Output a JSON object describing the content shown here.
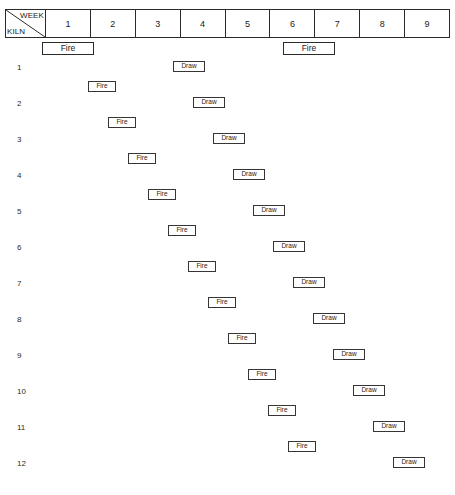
{
  "document": {
    "caption_fragment": "",
    "kiln_schedule_title": ""
  },
  "header_table": {
    "corner": {
      "top_label": "WEEK",
      "bottom_label": "KILN"
    },
    "week_columns": [
      "1",
      "2",
      "3",
      "4",
      "5",
      "6",
      "7",
      "8",
      "9"
    ]
  },
  "header_events": [
    {
      "label": "Fire",
      "x": 42,
      "y": 42,
      "w": 52,
      "h": 13
    },
    {
      "label": "Fire",
      "x": 283,
      "y": 42,
      "w": 52,
      "h": 13
    }
  ],
  "kiln_rows": [
    {
      "kiln": "1",
      "label_x": 17,
      "label_y": 63,
      "draw": {
        "label": "Draw",
        "x": 173,
        "y": 61,
        "w": 32,
        "h": 11
      },
      "fire": {
        "label": "Fire",
        "x": 88,
        "y": 81,
        "w": 28,
        "h": 11
      }
    },
    {
      "kiln": "2",
      "label_x": 17,
      "label_y": 99,
      "draw": {
        "label": "Draw",
        "x": 193,
        "y": 97,
        "w": 32,
        "h": 11
      },
      "fire": {
        "label": "Fire",
        "x": 108,
        "y": 117,
        "w": 28,
        "h": 11
      }
    },
    {
      "kiln": "3",
      "label_x": 17,
      "label_y": 135,
      "draw": {
        "label": "Draw",
        "x": 213,
        "y": 133,
        "w": 32,
        "h": 11
      },
      "fire": {
        "label": "Fire",
        "x": 128,
        "y": 153,
        "w": 28,
        "h": 11
      }
    },
    {
      "kiln": "4",
      "label_x": 17,
      "label_y": 171,
      "draw": {
        "label": "Draw",
        "x": 233,
        "y": 169,
        "w": 32,
        "h": 11
      },
      "fire": {
        "label": "Fire",
        "x": 148,
        "y": 189,
        "w": 28,
        "h": 11
      }
    },
    {
      "kiln": "5",
      "label_x": 17,
      "label_y": 207,
      "draw": {
        "label": "Draw",
        "x": 253,
        "y": 205,
        "w": 32,
        "h": 11
      },
      "fire": {
        "label": "Fire",
        "x": 168,
        "y": 225,
        "w": 28,
        "h": 11
      }
    },
    {
      "kiln": "6",
      "label_x": 17,
      "label_y": 243,
      "draw": {
        "label": "Draw",
        "x": 273,
        "y": 241,
        "w": 32,
        "h": 11
      },
      "fire": {
        "label": "Fire",
        "x": 188,
        "y": 261,
        "w": 28,
        "h": 11
      }
    },
    {
      "kiln": "7",
      "label_x": 17,
      "label_y": 279,
      "draw": {
        "label": "Draw",
        "x": 293,
        "y": 277,
        "w": 32,
        "h": 11
      },
      "fire": {
        "label": "Fire",
        "x": 208,
        "y": 297,
        "w": 28,
        "h": 11
      }
    },
    {
      "kiln": "8",
      "label_x": 17,
      "label_y": 315,
      "draw": {
        "label": "Draw",
        "x": 313,
        "y": 313,
        "w": 32,
        "h": 11
      },
      "fire": {
        "label": "Fire",
        "x": 228,
        "y": 333,
        "w": 28,
        "h": 11
      }
    },
    {
      "kiln": "9",
      "label_x": 17,
      "label_y": 351,
      "draw": {
        "label": "Draw",
        "x": 333,
        "y": 349,
        "w": 32,
        "h": 11
      },
      "fire": {
        "label": "Fire",
        "x": 248,
        "y": 369,
        "w": 28,
        "h": 11
      }
    },
    {
      "kiln": "10",
      "label_x": 17,
      "label_y": 387,
      "draw": {
        "label": "Draw",
        "x": 353,
        "y": 385,
        "w": 32,
        "h": 11
      },
      "fire": {
        "label": "Fire",
        "x": 268,
        "y": 405,
        "w": 28,
        "h": 11
      }
    },
    {
      "kiln": "11",
      "label_x": 17,
      "label_y": 423,
      "draw": {
        "label": "Draw",
        "x": 373,
        "y": 421,
        "w": 32,
        "h": 11
      },
      "fire": {
        "label": "Fire",
        "x": 288,
        "y": 441,
        "w": 28,
        "h": 11
      }
    },
    {
      "kiln": "12",
      "label_x": 17,
      "label_y": 459,
      "draw": {
        "label": "Draw",
        "x": 393,
        "y": 457,
        "w": 32,
        "h": 11
      },
      "fire": null
    }
  ],
  "colors": {
    "ink": "#2b2b2b",
    "box_border": "#353535",
    "background": "#ffffff"
  }
}
